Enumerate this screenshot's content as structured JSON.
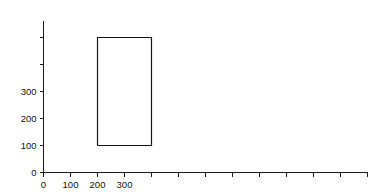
{
  "figure": {
    "background_color": "#ffffff",
    "line_color": "#161616",
    "axis_color": "#1a1a1a",
    "text_color": "#111111"
  },
  "chart_data": {
    "type": "line",
    "title": "",
    "subtitle": "",
    "xlabel": "",
    "ylabel": "",
    "xlim": [
      0,
      1200
    ],
    "ylim": [
      0,
      560
    ],
    "grid": false,
    "legend": null,
    "annotations": [],
    "x_ticks": [
      0,
      100,
      200,
      300,
      400,
      500,
      600,
      700,
      800,
      900,
      1000,
      1100,
      1200
    ],
    "x_tick_labels": [
      "0",
      "100",
      "200",
      "300",
      "",
      "",
      "",
      "",
      "",
      "",
      "",
      "",
      ""
    ],
    "y_ticks": [
      0,
      100,
      200,
      300,
      400,
      500
    ],
    "y_tick_labels": [
      "0",
      "100",
      "200",
      "300",
      "",
      ""
    ],
    "series": [
      {
        "name": "rectangle-outline",
        "type": "closed-polyline",
        "x": [
          200,
          400,
          400,
          200,
          200
        ],
        "y": [
          100,
          100,
          500,
          500,
          100
        ],
        "bounds": {
          "x_min": 200,
          "x_max": 400,
          "y_min": 100,
          "y_max": 500,
          "width": 200,
          "height": 400
        }
      }
    ]
  }
}
